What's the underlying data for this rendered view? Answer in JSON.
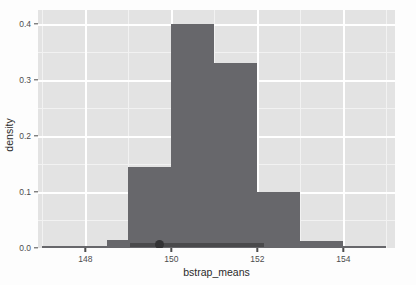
{
  "chart_data": {
    "type": "bar",
    "title": "",
    "subtitle": "",
    "xlabel": "bstrap_means",
    "ylabel": "density",
    "xlim": [
      146.9,
      155.2
    ],
    "ylim": [
      0.0,
      0.425
    ],
    "grid": true,
    "legend": null,
    "bin_width": 0.5,
    "x_ticks": [
      148,
      150,
      152,
      154
    ],
    "x_tick_labels": [
      "148",
      "150",
      "152",
      "154"
    ],
    "y_ticks": [
      0.0,
      0.1,
      0.2,
      0.3,
      0.4
    ],
    "y_tick_labels": [
      "0.0",
      "0.1",
      "0.2",
      "0.3",
      "0.4"
    ],
    "bar_color": "#67676b",
    "panel_color": "#e3e3e3",
    "grid_color": "#ffffff",
    "bins": [
      {
        "x_start": 147.0,
        "x_end": 147.5,
        "value": 0.004
      },
      {
        "x_start": 147.5,
        "x_end": 148.0,
        "value": 0.004
      },
      {
        "x_start": 148.0,
        "x_end": 148.5,
        "value": 0.004
      },
      {
        "x_start": 148.5,
        "x_end": 149.0,
        "value": 0.014
      },
      {
        "x_start": 149.0,
        "x_end": 149.5,
        "value": 0.145
      },
      {
        "x_start": 149.5,
        "x_end": 150.0,
        "value": 0.145
      },
      {
        "x_start": 150.0,
        "x_end": 150.5,
        "value": 0.4
      },
      {
        "x_start": 150.5,
        "x_end": 151.0,
        "value": 0.4
      },
      {
        "x_start": 151.0,
        "x_end": 151.5,
        "value": 0.33
      },
      {
        "x_start": 151.5,
        "x_end": 152.0,
        "value": 0.33
      },
      {
        "x_start": 152.0,
        "x_end": 152.5,
        "value": 0.1
      },
      {
        "x_start": 152.5,
        "x_end": 153.0,
        "value": 0.1
      },
      {
        "x_start": 153.0,
        "x_end": 153.5,
        "value": 0.013
      },
      {
        "x_start": 153.5,
        "x_end": 154.0,
        "value": 0.013
      },
      {
        "x_start": 154.0,
        "x_end": 154.5,
        "value": 0.004
      },
      {
        "x_start": 154.5,
        "x_end": 155.0,
        "value": 0.004
      }
    ],
    "annotations": {
      "interval": {
        "x_start": 149.05,
        "x_end": 152.15,
        "y": 0.0
      },
      "point_estimate": {
        "x": 149.73,
        "y": 0.0
      }
    }
  },
  "background_text": {
    "line1": "so the standard error of interval of the",
    "line2": "Another example",
    "line3": "To estimate the we have of the",
    "line4": "confidence"
  }
}
